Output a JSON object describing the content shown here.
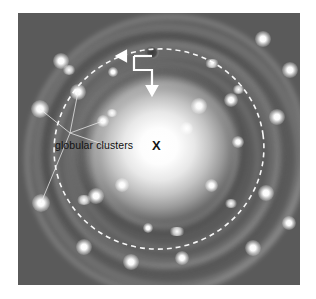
{
  "figure": {
    "kind": "annotated-astronomical-photograph",
    "background_color": "#ffffff"
  },
  "photo": {
    "left": 18,
    "top": 13,
    "width": 282,
    "height": 272,
    "sky_color": "#4b4b4b",
    "core_color": "#ffffff",
    "center": {
      "x": 159,
      "y": 149
    }
  },
  "annotations": {
    "globular_clusters_label": {
      "text": "globular clusters",
      "color": "#111111",
      "x": 55,
      "y": 139
    },
    "galactic_center_marker": {
      "text": "X",
      "color": "#151515",
      "x": 152,
      "y": 138
    },
    "leader_lines": {
      "color": "#f0f0f0",
      "origin": {
        "x": 70,
        "y": 133
      },
      "targets": [
        {
          "x": 40,
          "y": 109
        },
        {
          "x": 78,
          "y": 92
        },
        {
          "x": 103,
          "y": 121
        },
        {
          "x": 41,
          "y": 203
        }
      ]
    },
    "sun_marker": {
      "description": "small dark knot marking the position of the Sun",
      "x": 152,
      "y": 52,
      "rx": 7,
      "ry": 6,
      "color": "#3c3c3c"
    },
    "sun_callout": {
      "color": "#ffffff",
      "horizontal_arrow": {
        "from_x": 152,
        "from_y": 56,
        "to_x": 117,
        "to_y": 56
      },
      "vertical_arrow": {
        "from_x": 152,
        "from_y": 56,
        "to_x": 152,
        "to_y": 94
      },
      "elbow": {
        "x": 134,
        "y": 56,
        "y2": 70,
        "x2": 152
      }
    },
    "sun_orbit_ellipse": {
      "description": "dashed ellipse tracing the Sun's orbit around the galactic center",
      "color": "#ffffff",
      "style": "dashed",
      "cx": 159,
      "cy": 149,
      "rx": 105,
      "ry": 100,
      "rotation_deg": -8
    }
  },
  "halo_objects": {
    "note": "bright point sources in the halo representing globular clusters and foreground stars",
    "points": [
      {
        "x": 61,
        "y": 61,
        "r": 6.5
      },
      {
        "x": 152,
        "y": 52,
        "r": 5.0
      },
      {
        "x": 263,
        "y": 39,
        "r": 6.0
      },
      {
        "x": 290,
        "y": 70,
        "r": 6.5
      },
      {
        "x": 40,
        "y": 109,
        "r": 7.0
      },
      {
        "x": 78,
        "y": 92,
        "r": 6.5
      },
      {
        "x": 103,
        "y": 121,
        "r": 4.5
      },
      {
        "x": 199,
        "y": 106,
        "r": 6.0
      },
      {
        "x": 231,
        "y": 100,
        "r": 5.5
      },
      {
        "x": 277,
        "y": 117,
        "r": 6.5
      },
      {
        "x": 186,
        "y": 128,
        "r": 5.0
      },
      {
        "x": 41,
        "y": 203,
        "r": 7.0
      },
      {
        "x": 96,
        "y": 196,
        "r": 6.0
      },
      {
        "x": 122,
        "y": 185,
        "r": 5.5
      },
      {
        "x": 211,
        "y": 185,
        "r": 5.0
      },
      {
        "x": 266,
        "y": 193,
        "r": 6.5
      },
      {
        "x": 84,
        "y": 247,
        "r": 6.5
      },
      {
        "x": 131,
        "y": 262,
        "r": 6.0
      },
      {
        "x": 182,
        "y": 258,
        "r": 5.5
      },
      {
        "x": 253,
        "y": 248,
        "r": 6.5
      },
      {
        "x": 289,
        "y": 223,
        "r": 5.5
      },
      {
        "x": 113,
        "y": 72,
        "r": 4.0
      },
      {
        "x": 148,
        "y": 228,
        "r": 4.0
      },
      {
        "x": 238,
        "y": 142,
        "r": 4.5
      }
    ]
  }
}
